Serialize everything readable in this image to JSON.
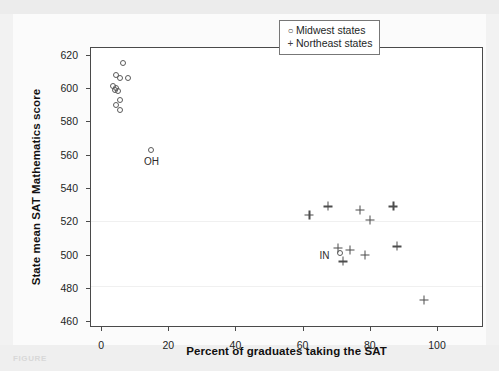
{
  "figure": {
    "caption_label": "FIGURE",
    "background_color": "#f2f2f2",
    "plot_background_color": "#ffffff",
    "frame_color": "#4a4a4a",
    "marker_color": "#4d4d4d"
  },
  "legend": {
    "position": "top-right",
    "entries": [
      {
        "glyph": "circle-marker-icon",
        "symbol": "○",
        "label": "Midwest states"
      },
      {
        "glyph": "plus-marker-icon",
        "symbol": "+",
        "label": "Northeast states"
      }
    ]
  },
  "chart_data": {
    "type": "scatter",
    "title": "",
    "subtitle": "",
    "xlabel": "Percent of graduates taking the SAT",
    "ylabel": "State mean SAT Mathematics score",
    "xlim": [
      -3,
      114
    ],
    "ylim": [
      456,
      624
    ],
    "xticks": [
      0,
      20,
      40,
      60,
      80,
      100
    ],
    "xtick_labels": [
      "0",
      "20",
      "40",
      "60",
      "80",
      "100"
    ],
    "yticks": [
      460,
      480,
      500,
      520,
      540,
      560,
      580,
      600,
      620
    ],
    "ytick_labels": [
      "460",
      "480",
      "500",
      "520",
      "540",
      "560",
      "580",
      "600",
      "620"
    ],
    "grid": false,
    "legend_position": "upper right",
    "series": [
      {
        "name": "Midwest states",
        "marker": "open-circle",
        "x": [
          6.5,
          4.5,
          5.5,
          8.0,
          3.5,
          4.5,
          4.0,
          5.0,
          5.5,
          4.5,
          5.5,
          15.0,
          71.0
        ],
        "y": [
          615,
          608,
          606,
          606,
          601,
          600,
          599,
          598,
          593,
          590,
          587,
          563,
          501
        ],
        "point_labels": [
          "",
          "",
          "",
          "",
          "",
          "",
          "",
          "",
          "",
          "",
          "",
          "OH",
          "IN"
        ]
      },
      {
        "name": "Northeast states",
        "marker": "plus",
        "x": [
          62.0,
          67.5,
          77.0,
          80.0,
          87.0,
          70.5,
          74.0,
          78.5,
          88.0,
          72.0,
          96.0
        ],
        "y": [
          524,
          529,
          527,
          521,
          529,
          504,
          503,
          500,
          505,
          496,
          473
        ],
        "point_labels": [
          "",
          "",
          "",
          "",
          "",
          "",
          "",
          "",
          "",
          "",
          ""
        ]
      }
    ],
    "annotations": [
      {
        "text": "OH",
        "x": 15.0,
        "y": 556
      },
      {
        "text": "IN",
        "x": 66.5,
        "y": 500
      }
    ]
  }
}
